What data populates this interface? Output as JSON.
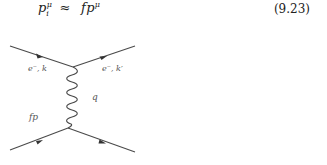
{
  "equation": {
    "lhs_base": "p",
    "lhs_sup": "μ",
    "lhs_sub": "i",
    "relation": "≈",
    "rhs_factor": "f",
    "rhs_base": "p",
    "rhs_sup": "μ",
    "number": "(9.23)"
  },
  "diagram": {
    "type": "feynman",
    "labels": {
      "incoming_electron": "e⁻, k",
      "outgoing_electron": "e⁻, k′",
      "photon": "q",
      "incoming_parton": "fp"
    },
    "line_color": "#4a4a4a"
  }
}
